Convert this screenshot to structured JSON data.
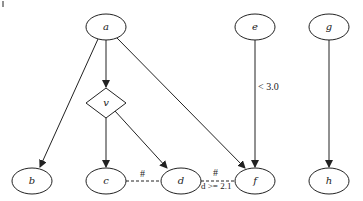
{
  "diagram": {
    "type": "directed-graph",
    "nodes": {
      "a": {
        "label": "a",
        "shape": "ellipse"
      },
      "e": {
        "label": "e",
        "shape": "ellipse"
      },
      "g": {
        "label": "g",
        "shape": "ellipse"
      },
      "v": {
        "label": "v",
        "shape": "diamond"
      },
      "b": {
        "label": "b",
        "shape": "ellipse"
      },
      "c": {
        "label": "c",
        "shape": "ellipse"
      },
      "d": {
        "label": "d",
        "shape": "ellipse"
      },
      "f": {
        "label": "f",
        "shape": "ellipse"
      },
      "h": {
        "label": "h",
        "shape": "ellipse"
      }
    },
    "edges": [
      {
        "from": "a",
        "to": "b",
        "style": "solid",
        "directed": true,
        "label": ""
      },
      {
        "from": "a",
        "to": "v",
        "style": "solid",
        "directed": true,
        "label": ""
      },
      {
        "from": "a",
        "to": "f",
        "style": "solid",
        "directed": true,
        "label": ""
      },
      {
        "from": "v",
        "to": "c",
        "style": "solid",
        "directed": true,
        "label": ""
      },
      {
        "from": "v",
        "to": "d",
        "style": "solid",
        "directed": true,
        "label": ""
      },
      {
        "from": "e",
        "to": "f",
        "style": "solid",
        "directed": true,
        "label": "< 3.0"
      },
      {
        "from": "g",
        "to": "h",
        "style": "solid",
        "directed": true,
        "label": ""
      },
      {
        "from": "c",
        "to": "d",
        "style": "dashed",
        "directed": false,
        "label": "#"
      },
      {
        "from": "d",
        "to": "f",
        "style": "dashed",
        "directed": false,
        "label": "#",
        "sublabel": "d >= 2.1"
      }
    ]
  },
  "labels": {
    "e_f": "< 3.0",
    "c_d": "#",
    "d_f_top": "#",
    "d_f_bottom": "d >= 2.1"
  }
}
